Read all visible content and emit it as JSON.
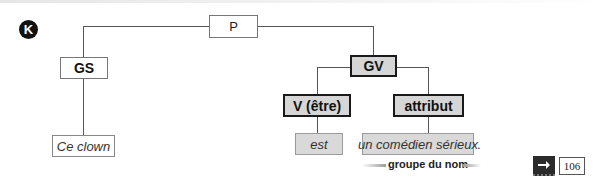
{
  "exercise": {
    "badge": "K"
  },
  "tree": {
    "root": {
      "label": "P"
    },
    "subject_group": {
      "label": "GS",
      "leaf": "Ce clown"
    },
    "verb_group": {
      "label": "GV",
      "verb": {
        "label": "V (être)",
        "leaf": "est"
      },
      "attribute": {
        "label": "attribut",
        "leaf": "un comédien sérieux"
      }
    },
    "sentence_end": "."
  },
  "annotation": {
    "label": "groupe du nom"
  },
  "reference": {
    "icon": "arrow-right-icon",
    "page": "106"
  },
  "colors": {
    "highlight_grey": "#d6d6d6",
    "line": "#555555",
    "badge": "#111111"
  }
}
